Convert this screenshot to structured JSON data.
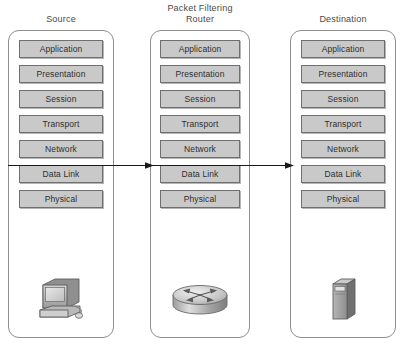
{
  "diagram": {
    "colors": {
      "layer_fill": "#c9c9c9",
      "layer_border": "#6f6f6f",
      "container_border": "#8e8e8e",
      "text": "#2e2e2e",
      "arrow": "#1a1a1a",
      "background": "#ffffff"
    },
    "columns": [
      {
        "id": "source",
        "title": "Source",
        "device_icon": "desktop-computer-icon",
        "layers": [
          "Application",
          "Presentation",
          "Session",
          "Transport",
          "Network",
          "Data Link",
          "Physical"
        ]
      },
      {
        "id": "router",
        "title": "Packet Filtering\nRouter",
        "device_icon": "router-icon",
        "layers": [
          "Application",
          "Presentation",
          "Session",
          "Transport",
          "Network",
          "Data Link",
          "Physical"
        ]
      },
      {
        "id": "destination",
        "title": "Destination",
        "device_icon": "server-icon",
        "layers": [
          "Application",
          "Presentation",
          "Session",
          "Transport",
          "Network",
          "Data Link",
          "Physical"
        ]
      }
    ],
    "connectors": [
      {
        "id": "arrow-source-to-router",
        "from": "source",
        "to": "router",
        "direction": "right",
        "at_layer_boundary": "Transport/Network"
      },
      {
        "id": "arrow-router-to-destination",
        "from": "router",
        "to": "destination",
        "direction": "right",
        "at_layer_boundary": "Transport/Network"
      }
    ]
  }
}
